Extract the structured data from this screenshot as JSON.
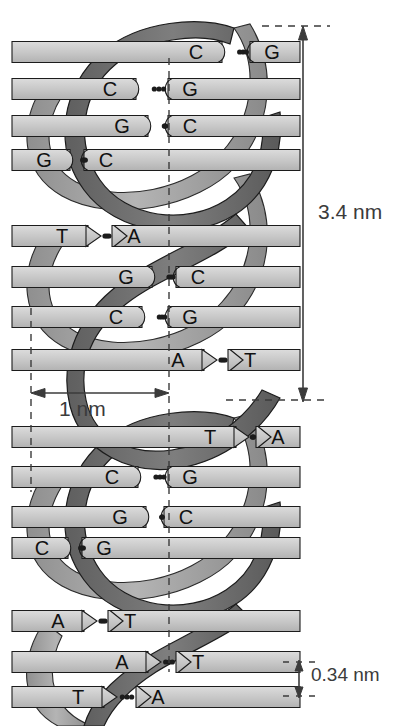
{
  "figure": {
    "width": 407,
    "height": 726
  },
  "dimensions": {
    "major_turn": {
      "label": "3.4 nm",
      "orientation": "vertical",
      "meaning": "one full helical turn"
    },
    "diameter": {
      "label": "1 nm",
      "orientation": "horizontal",
      "meaning": "helix diameter"
    },
    "base_rise": {
      "label": "0.34 nm",
      "orientation": "vertical",
      "meaning": "rise per base pair"
    }
  },
  "colors": {
    "backbone_dark": "#6f6f6f",
    "backbone_light": "#a8a8a8",
    "rung_fill": "#c9c9c9",
    "rung_fill_light": "#dedede",
    "outline": "#1c1c1c",
    "dimension_line": "#3b3b3b",
    "background": "#ffffff"
  },
  "base_pairs": [
    {
      "index": 1,
      "left": "C",
      "right": "G",
      "bonds": 3,
      "y": 52,
      "x_left": 196,
      "x_right": 260,
      "shape": "right-notch"
    },
    {
      "index": 2,
      "left": "C",
      "right": "G",
      "bonds": 3,
      "y": 89,
      "x_left": 110,
      "x_right": 178,
      "shape": "right-notch"
    },
    {
      "index": 3,
      "left": "G",
      "right": "C",
      "bonds": 3,
      "y": 126,
      "x_left": 122,
      "x_right": 178,
      "shape": "left-notch"
    },
    {
      "index": 4,
      "left": "G",
      "right": "C",
      "bonds": 3,
      "y": 160,
      "x_left": 44,
      "x_right": 94,
      "shape": "left-notch"
    },
    {
      "index": 5,
      "left": "T",
      "right": "A",
      "bonds": 2,
      "y": 236,
      "x_left": 62,
      "x_right": 122,
      "shape": "arrow"
    },
    {
      "index": 6,
      "left": "G",
      "right": "C",
      "bonds": 3,
      "y": 277,
      "x_left": 126,
      "x_right": 186,
      "shape": "left-notch"
    },
    {
      "index": 7,
      "left": "C",
      "right": "G",
      "bonds": 3,
      "y": 317,
      "x_left": 116,
      "x_right": 178,
      "shape": "right-notch"
    },
    {
      "index": 8,
      "left": "A",
      "right": "T",
      "bonds": 2,
      "y": 360,
      "x_left": 178,
      "x_right": 238,
      "shape": "arrow"
    },
    {
      "index": 9,
      "left": "T",
      "right": "A",
      "bonds": 2,
      "y": 437,
      "x_left": 210,
      "x_right": 266,
      "shape": "arrow"
    },
    {
      "index": 10,
      "left": "C",
      "right": "G",
      "bonds": 3,
      "y": 477,
      "x_left": 112,
      "x_right": 178,
      "shape": "right-notch"
    },
    {
      "index": 11,
      "left": "G",
      "right": "C",
      "bonds": 3,
      "y": 517,
      "x_left": 120,
      "x_right": 174,
      "shape": "left-notch"
    },
    {
      "index": 12,
      "left": "C",
      "right": "G",
      "bonds": 3,
      "y": 548,
      "x_left": 42,
      "x_right": 92,
      "shape": "right-notch"
    },
    {
      "index": 13,
      "left": "A",
      "right": "T",
      "bonds": 2,
      "y": 621,
      "x_left": 58,
      "x_right": 118,
      "shape": "arrow"
    },
    {
      "index": 14,
      "left": "A",
      "right": "T",
      "bonds": 2,
      "y": 662,
      "x_left": 122,
      "x_right": 186,
      "shape": "arrow"
    },
    {
      "index": 15,
      "left": "T",
      "right": "A",
      "bonds": 2,
      "y": 697,
      "x_left": 78,
      "x_right": 146,
      "shape": "arrow"
    }
  ],
  "guides": {
    "vertical_left_x": 31,
    "vertical_center_x": 169,
    "horizontal_top_y": 26,
    "horizontal_bottom_y": 400
  }
}
